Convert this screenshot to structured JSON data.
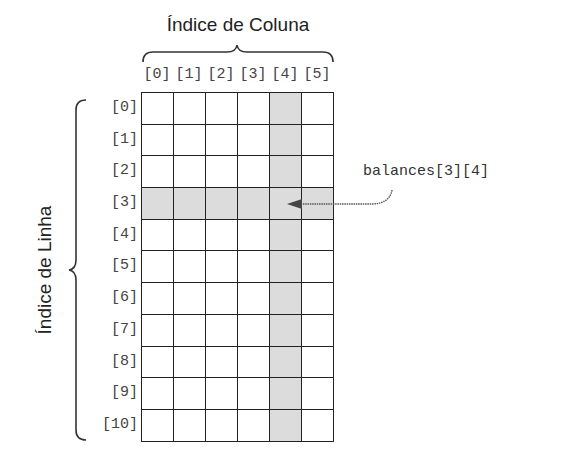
{
  "title_column": "Índice de Coluna",
  "title_row": "Índice de Linha",
  "column_labels": [
    "[0]",
    "[1]",
    "[2]",
    "[3]",
    "[4]",
    "[5]"
  ],
  "row_labels": [
    "[0]",
    "[1]",
    "[2]",
    "[3]",
    "[4]",
    "[5]",
    "[6]",
    "[7]",
    "[8]",
    "[9]",
    "[10]"
  ],
  "grid": {
    "rows": 11,
    "cols": 6,
    "highlight_row": 3,
    "highlight_col": 4,
    "highlight_color": "#dcdcdc"
  },
  "annotation": "balances[3][4]"
}
